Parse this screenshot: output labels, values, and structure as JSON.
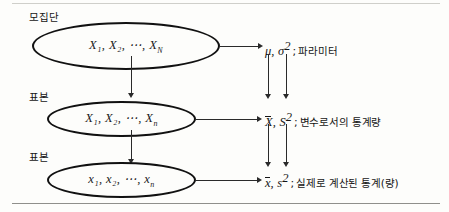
{
  "figure": {
    "ink_color": "#151515"
  },
  "levels": [
    {
      "side_label": "모집단",
      "ellipse_text_prefix": "X",
      "ellipse_text": "X₁, X₂, ⋯, X",
      "ellipse_subscript": "N",
      "right_symbols": "μ, σ",
      "right_symbol_sup": "2",
      "right_separator": ";",
      "right_description": "파라미터"
    },
    {
      "side_label": "표본",
      "ellipse_text_prefix": "X",
      "ellipse_text": "X₁, X₂, ⋯, X",
      "ellipse_subscript": "n",
      "right_symbols": "X, S",
      "right_symbol_sup": "2",
      "right_separator": ";",
      "right_description": "변수로서의 통계량"
    },
    {
      "side_label": "표본",
      "ellipse_text_prefix": "x",
      "ellipse_text": "x₁, x₂, ⋯, x",
      "ellipse_subscript": "n",
      "right_symbols": "x, s",
      "right_symbol_sup": "2",
      "right_separator": ";",
      "right_description": "실제로 계산된 통계(량)"
    }
  ],
  "math": {
    "mu": "μ",
    "sigma": "σ",
    "x_bar_cap": "X",
    "s_cap": "S",
    "x_bar_low": "x",
    "s_low": "s",
    "comma": ",",
    "sup2": "2"
  }
}
